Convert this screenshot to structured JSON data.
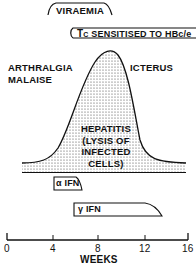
{
  "labels": {
    "viraemia": "VIRAEMIA",
    "tc_prefix": "T",
    "tc_sub": "C",
    "tc_rest": "SENSITISED TO HBc/e",
    "arthralgia": "ARTHRALGIA",
    "malaise": "MALAISE",
    "icterus": "ICTERUS",
    "hepatitis_line1": "HEPATITIS",
    "hepatitis_line2": "(LYSIS OF",
    "hepatitis_line3": "INFECTED",
    "hepatitis_line4": "CELLS)",
    "alpha_ifn": "α IFN",
    "gamma_ifn": "γ IFN"
  },
  "axis": {
    "label": "WEEKS",
    "ticks": [
      "0",
      "4",
      "8",
      "12",
      "16"
    ]
  },
  "colors": {
    "ink": "#111111",
    "fill_dots": "#444444",
    "background": "#ffffff"
  }
}
